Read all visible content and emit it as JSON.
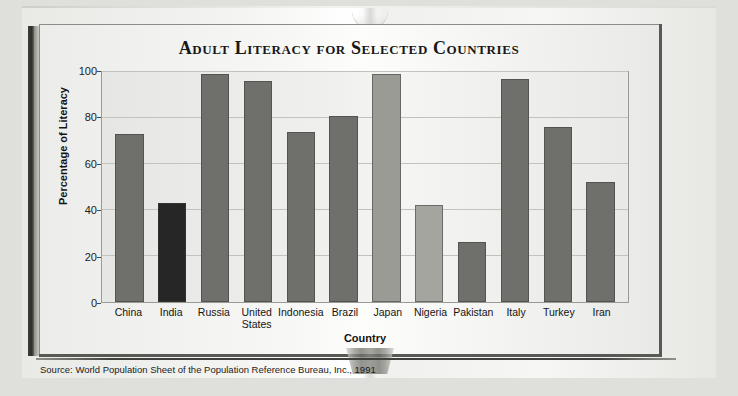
{
  "chart_data": {
    "type": "bar",
    "title": "Adult Literacy for Selected Countries",
    "xlabel": "Country",
    "ylabel": "Percentage of Literacy",
    "ylim": [
      0,
      100
    ],
    "yticks": [
      0,
      20,
      40,
      60,
      80,
      100
    ],
    "grid": true,
    "legend": "none",
    "categories": [
      "China",
      "India",
      "Russia",
      "United States",
      "Indonesia",
      "Brazil",
      "Japan",
      "Nigeria",
      "Pakistan",
      "Italy",
      "Turkey",
      "Iran"
    ],
    "values": [
      73,
      43,
      99,
      96,
      74,
      81,
      99,
      42,
      26,
      97,
      76,
      52
    ],
    "bar_colors": [
      "#6f6f6b",
      "#262626",
      "#6f6f6b",
      "#6f6f6b",
      "#6f6f6b",
      "#6f6f6b",
      "#9b9b96",
      "#a5a5a0",
      "#6f6f6b",
      "#6f6f6b",
      "#6f6f6b",
      "#6f6f6b"
    ],
    "source": "Source: World Population Sheet of the Population Reference Bureau, Inc., 1991"
  },
  "colors": {
    "bar_default": "#6f6f6b",
    "bar_dark": "#262626",
    "bar_light": "#9b9b96",
    "plot_bg": "#f0f0ee",
    "frame": "#585854",
    "text": "#141414"
  }
}
